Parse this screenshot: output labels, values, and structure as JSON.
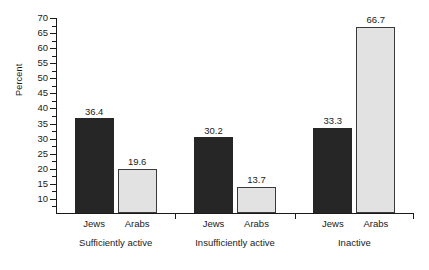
{
  "chart_data": {
    "type": "bar",
    "title": "",
    "xlabel": "",
    "ylabel": "Percent",
    "ylim": [
      5,
      70
    ],
    "ytick_step": 5,
    "yticks": [
      10,
      15,
      20,
      25,
      30,
      35,
      40,
      45,
      50,
      55,
      60,
      65,
      70
    ],
    "ytick_labels": [
      "10",
      "15",
      "20",
      "25",
      "30",
      "35",
      "40",
      "45",
      "50",
      "55",
      "60",
      "65",
      "70"
    ],
    "minor_ticks": true,
    "grid": false,
    "legend": "none",
    "categories": [
      "Sufficiently active",
      "Insufficiently active",
      "Inactive"
    ],
    "series": [
      {
        "name": "Jews",
        "color": "#262626",
        "values": [
          36.4,
          30.2,
          33.3
        ],
        "labels": [
          "36.4",
          "30.2",
          "33.3"
        ]
      },
      {
        "name": "Arabs",
        "color": "#e2e2e2",
        "values": [
          19.6,
          13.7,
          66.7
        ],
        "labels": [
          "19.6",
          "13.7",
          "66.7"
        ]
      }
    ]
  },
  "axis": {
    "y_title": "Percent"
  },
  "colors": {
    "series_jews": "#262626",
    "series_arabs": "#e2e2e2",
    "axis": "#1a1a1a",
    "background": "#ffffff"
  }
}
